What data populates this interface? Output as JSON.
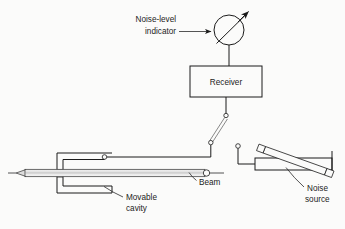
{
  "figure": {
    "kind": "schematic-diagram",
    "background_color": "#fbfbfa",
    "line_color": "#1b1b1b",
    "text_color": "#1b1b1b"
  },
  "labels": {
    "noise_level_indicator_line1": "Noise-level",
    "noise_level_indicator_line2": "indicator",
    "receiver": "Receiver",
    "beam": "Beam",
    "movable_cavity_line1": "Movable",
    "movable_cavity_line2": "cavity",
    "noise_source_line1": "Noise",
    "noise_source_line2": "source"
  },
  "components": {
    "indicator": {
      "name": "noise-level-indicator",
      "shape": "circle-with-needle",
      "center_x": 229,
      "center_y": 30,
      "radius": 15,
      "needle_angle_deg": -42,
      "has_arrowhead": true
    },
    "receiver": {
      "name": "receiver-box",
      "shape": "rectangle",
      "x": 190,
      "y": 66,
      "width": 72,
      "height": 31
    },
    "cable": {
      "name": "flexible-coax-cable",
      "shape": "double-line-diagonal",
      "from_x": 226,
      "from_y": 115,
      "to_x": 211,
      "to_y": 142,
      "end_connector_radius": 2.2
    },
    "movable_cavity": {
      "name": "movable-cavity",
      "shape": "nested-c-brackets-open-right",
      "outer_x": 57,
      "outer_y": 153,
      "outer_right": 112,
      "outer_bottom": 193
    },
    "beam": {
      "name": "beam-tube",
      "shape": "horizontal-tube",
      "left_x": 16,
      "right_x": 208,
      "center_y": 173,
      "tip_style": "tapered-point-left",
      "right_terminal": "small-circle"
    },
    "noise_source": {
      "name": "noise-source-waveguide",
      "shape": "waveguide-with-diagonal-noise-tube",
      "guide_left": 255,
      "guide_right": 332,
      "guide_top": 158,
      "guide_bottom": 170,
      "tube_caps": 2
    },
    "noise_source_feed": {
      "name": "noise-source-feed-line",
      "connector_x": 238,
      "connector_y": 146,
      "connector_radius": 2.2
    }
  },
  "leader_lines": [
    {
      "name": "leader-noise-level-indicator",
      "points": "179,32 212,32",
      "arrow": "right"
    },
    {
      "name": "leader-beam",
      "points": "196,179 190,172",
      "arrow": "up-left"
    },
    {
      "name": "leader-movable-cavity",
      "points": "122,196 104,186",
      "arrow": "up-left"
    },
    {
      "name": "leader-noise-source",
      "points": "302,186 283,170",
      "arrow": "up-left"
    }
  ]
}
